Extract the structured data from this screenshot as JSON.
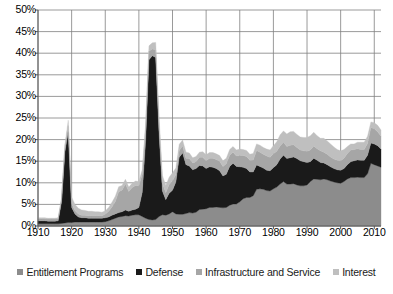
{
  "chart_data": {
    "type": "area",
    "stacked": true,
    "title": "",
    "subtitle": "",
    "xlabel": "",
    "ylabel": "",
    "xlim": [
      1910,
      2012
    ],
    "ylim": [
      0,
      50
    ],
    "ytick_labels": [
      "0%",
      "5%",
      "10%",
      "15%",
      "20%",
      "25%",
      "30%",
      "35%",
      "40%",
      "45%",
      "50%"
    ],
    "ytick_values": [
      0,
      5,
      10,
      15,
      20,
      25,
      30,
      35,
      40,
      45,
      50
    ],
    "xtick_labels": [
      "1910",
      "1920",
      "1930",
      "1940",
      "1950",
      "1960",
      "1970",
      "1980",
      "1990",
      "2000",
      "2010"
    ],
    "xtick_values": [
      1910,
      1920,
      1930,
      1940,
      1950,
      1960,
      1970,
      1980,
      1990,
      2000,
      2010
    ],
    "grid": true,
    "legend_position": "bottom",
    "value_unit": "percent",
    "x": [
      1910,
      1911,
      1912,
      1913,
      1914,
      1915,
      1916,
      1917,
      1918,
      1919,
      1920,
      1921,
      1922,
      1923,
      1924,
      1925,
      1926,
      1927,
      1928,
      1929,
      1930,
      1931,
      1932,
      1933,
      1934,
      1935,
      1936,
      1937,
      1938,
      1939,
      1940,
      1941,
      1942,
      1943,
      1944,
      1945,
      1946,
      1947,
      1948,
      1949,
      1950,
      1951,
      1952,
      1953,
      1954,
      1955,
      1956,
      1957,
      1958,
      1959,
      1960,
      1961,
      1962,
      1963,
      1964,
      1965,
      1966,
      1967,
      1968,
      1969,
      1970,
      1971,
      1972,
      1973,
      1974,
      1975,
      1976,
      1977,
      1978,
      1979,
      1980,
      1981,
      1982,
      1983,
      1984,
      1985,
      1986,
      1987,
      1988,
      1989,
      1990,
      1991,
      1992,
      1993,
      1994,
      1995,
      1996,
      1997,
      1998,
      1999,
      2000,
      2001,
      2002,
      2003,
      2004,
      2005,
      2006,
      2007,
      2008,
      2009,
      2010,
      2011,
      2012
    ],
    "series": [
      {
        "name": "Entitlement Programs",
        "color": "#8c8c8c",
        "values": [
          0.5,
          0.5,
          0.5,
          0.5,
          0.5,
          0.5,
          0.5,
          0.6,
          0.7,
          0.8,
          0.8,
          0.9,
          0.9,
          0.9,
          0.9,
          0.9,
          0.9,
          0.9,
          0.9,
          0.9,
          1.0,
          1.2,
          1.5,
          1.8,
          2.1,
          2.2,
          2.4,
          2.3,
          2.5,
          2.6,
          2.6,
          2.2,
          1.8,
          1.5,
          1.4,
          1.5,
          2.2,
          2.6,
          2.5,
          2.8,
          3.3,
          2.8,
          2.7,
          2.7,
          2.9,
          3.1,
          3.0,
          3.2,
          3.8,
          3.9,
          4.0,
          4.3,
          4.3,
          4.4,
          4.3,
          4.2,
          4.3,
          4.8,
          5.1,
          5.1,
          5.6,
          6.3,
          6.6,
          6.6,
          7.0,
          8.5,
          8.6,
          8.5,
          8.2,
          8.1,
          8.6,
          9.0,
          9.7,
          10.3,
          9.7,
          9.7,
          9.8,
          9.5,
          9.3,
          9.3,
          9.5,
          10.3,
          10.9,
          10.8,
          10.7,
          10.9,
          10.7,
          10.4,
          10.2,
          10.0,
          9.9,
          10.3,
          10.9,
          11.2,
          11.2,
          11.3,
          11.2,
          11.2,
          12.1,
          14.5,
          14.2,
          13.9,
          13.6
        ]
      },
      {
        "name": "Defense",
        "color": "#1a1a1a",
        "values": [
          0.7,
          0.7,
          0.7,
          0.6,
          0.6,
          0.6,
          0.7,
          5.0,
          16.5,
          21.0,
          3.5,
          1.9,
          1.2,
          1.0,
          1.0,
          0.9,
          0.9,
          0.9,
          0.9,
          0.9,
          0.9,
          0.9,
          1.0,
          1.0,
          1.0,
          1.1,
          1.3,
          1.1,
          1.2,
          1.3,
          1.7,
          5.6,
          17.8,
          37.0,
          38.0,
          37.5,
          19.2,
          5.5,
          3.6,
          4.8,
          5.0,
          7.4,
          13.2,
          14.2,
          11.3,
          10.8,
          10.0,
          10.1,
          10.2,
          10.0,
          9.3,
          9.4,
          9.3,
          8.9,
          8.5,
          7.4,
          7.7,
          9.0,
          9.4,
          8.7,
          8.1,
          7.3,
          6.7,
          5.9,
          5.5,
          5.6,
          5.2,
          4.9,
          4.7,
          4.7,
          4.9,
          5.2,
          5.8,
          6.1,
          5.9,
          6.1,
          6.2,
          6.1,
          5.8,
          5.6,
          5.2,
          4.6,
          4.8,
          4.4,
          4.0,
          3.7,
          3.5,
          3.3,
          3.1,
          3.0,
          3.0,
          3.0,
          3.3,
          3.7,
          3.9,
          4.0,
          4.0,
          4.0,
          4.3,
          4.7,
          4.8,
          4.7,
          4.2
        ]
      },
      {
        "name": "Infrastructure and Service",
        "color": "#a6a6a6",
        "values": [
          0.5,
          0.5,
          0.5,
          0.5,
          0.5,
          0.5,
          0.5,
          0.6,
          1.2,
          1.4,
          0.9,
          0.8,
          0.7,
          0.6,
          0.6,
          0.6,
          0.6,
          0.6,
          0.6,
          0.6,
          0.8,
          1.3,
          1.9,
          2.9,
          4.8,
          5.0,
          6.0,
          4.6,
          5.2,
          5.5,
          5.0,
          4.2,
          3.0,
          2.0,
          1.6,
          1.8,
          2.0,
          1.8,
          1.6,
          2.0,
          2.2,
          1.7,
          1.6,
          1.6,
          1.5,
          1.7,
          1.6,
          1.6,
          1.9,
          2.0,
          1.8,
          2.0,
          2.1,
          2.1,
          2.2,
          2.2,
          2.4,
          2.6,
          2.6,
          2.4,
          2.6,
          2.7,
          2.8,
          2.7,
          2.8,
          3.4,
          3.3,
          3.2,
          3.3,
          3.1,
          3.2,
          3.1,
          3.0,
          3.0,
          2.8,
          2.9,
          2.8,
          2.6,
          2.5,
          2.5,
          2.6,
          2.7,
          2.8,
          2.7,
          2.7,
          2.5,
          2.4,
          2.3,
          2.2,
          2.2,
          2.2,
          2.4,
          2.6,
          2.7,
          2.6,
          2.6,
          2.5,
          2.5,
          2.7,
          3.6,
          3.5,
          3.2,
          3.0
        ]
      },
      {
        "name": "Interest",
        "color": "#bfbfbf",
        "values": [
          0.2,
          0.2,
          0.2,
          0.2,
          0.2,
          0.2,
          0.2,
          0.2,
          0.4,
          1.3,
          1.5,
          1.4,
          1.3,
          1.2,
          1.1,
          1.0,
          1.0,
          0.9,
          0.9,
          0.8,
          0.8,
          0.9,
          1.1,
          1.2,
          1.2,
          1.1,
          1.1,
          1.0,
          1.0,
          1.0,
          1.0,
          1.0,
          1.0,
          1.2,
          1.4,
          1.7,
          1.8,
          1.8,
          1.7,
          1.7,
          1.8,
          1.5,
          1.4,
          1.4,
          1.4,
          1.3,
          1.2,
          1.2,
          1.2,
          1.3,
          1.4,
          1.3,
          1.3,
          1.3,
          1.3,
          1.3,
          1.3,
          1.3,
          1.3,
          1.4,
          1.5,
          1.4,
          1.4,
          1.4,
          1.5,
          1.5,
          1.6,
          1.6,
          1.6,
          1.7,
          1.9,
          2.2,
          2.6,
          2.6,
          2.9,
          3.1,
          3.1,
          3.0,
          3.0,
          3.1,
          3.2,
          3.3,
          3.2,
          3.0,
          2.9,
          3.2,
          3.1,
          3.0,
          2.8,
          2.5,
          2.3,
          2.0,
          1.6,
          1.4,
          1.3,
          1.5,
          1.7,
          1.7,
          1.7,
          1.3,
          1.4,
          1.5,
          1.4
        ]
      }
    ]
  },
  "legend": {
    "items": [
      {
        "label": "Entitlement Programs",
        "color": "#8c8c8c",
        "name": "entitlement-programs"
      },
      {
        "label": "Defense",
        "color": "#1a1a1a",
        "name": "defense"
      },
      {
        "label": "Infrastructure and Service",
        "color": "#a6a6a6",
        "name": "infrastructure-and-service"
      },
      {
        "label": "Interest",
        "color": "#bfbfbf",
        "name": "interest"
      }
    ]
  },
  "axes": {
    "grid_color": "#808080",
    "axis_color": "#595959",
    "background": "#ffffff"
  }
}
